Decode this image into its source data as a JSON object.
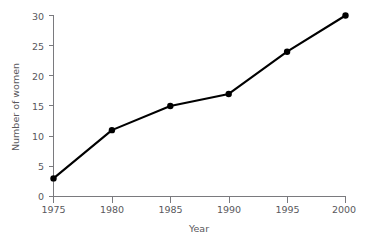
{
  "chart_data": {
    "type": "line",
    "title": "",
    "subtitle": "",
    "xlabel": "Year",
    "ylabel": "Number of women",
    "x": [
      1975,
      1980,
      1985,
      1990,
      1995,
      2000
    ],
    "values": [
      3,
      11,
      15,
      17,
      24,
      30
    ],
    "categories": [
      "1975",
      "1980",
      "1985",
      "1990",
      "1995",
      "2000"
    ],
    "xtick_labels": [
      "1975",
      "1980",
      "1985",
      "1990",
      "1995",
      "2000"
    ],
    "ytick_labels": [
      "0",
      "5",
      "10",
      "15",
      "20",
      "25",
      "30"
    ],
    "yticks": [
      0,
      5,
      10,
      15,
      20,
      25,
      30
    ],
    "xlim": [
      1975,
      2000
    ],
    "ylim": [
      0,
      30
    ],
    "grid": false,
    "legend": false,
    "legend_position": "none",
    "marker": "filled-circle",
    "series": [
      {
        "name": "Number of women",
        "values": [
          3,
          11,
          15,
          17,
          24,
          30
        ]
      }
    ],
    "colors": {
      "line": "#000000",
      "marker": "#000000",
      "axis": "#7a7a7e",
      "text": "#59585c",
      "background": "#ffffff"
    }
  },
  "labels": {
    "y_axis_title": "Number of women",
    "x_axis_title": "Year",
    "y_ticks": [
      "30",
      "25",
      "20",
      "15",
      "10",
      "5",
      "0"
    ],
    "x_ticks": [
      "1975",
      "1980",
      "1985",
      "1990",
      "1995",
      "2000"
    ]
  }
}
